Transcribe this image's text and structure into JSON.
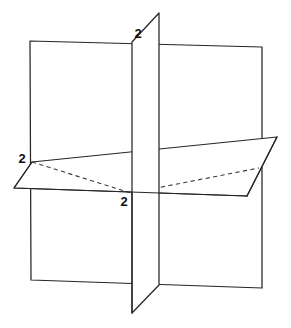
{
  "figure": {
    "background_color": "#ffffff",
    "line_color": "#26262b",
    "hidden_line_color": "#3a3a40",
    "label_color": "#0d0d10",
    "canvas": {
      "width": 291,
      "height": 328
    }
  },
  "labels": {
    "top": "2",
    "left": "2",
    "center": "2"
  },
  "label_positions": {
    "top": {
      "x": 138,
      "y": 38
    },
    "left": {
      "x": 22,
      "y": 163
    },
    "center": {
      "x": 124,
      "y": 206
    }
  },
  "chart_data": {
    "type": "diagram",
    "annotations": [
      "2",
      "2",
      "2"
    ],
    "shapes": [
      {
        "name": "back-plane",
        "kind": "square-plane",
        "points": [
          [
            30,
            41
          ],
          [
            262,
            47
          ],
          [
            262,
            288
          ],
          [
            31,
            280
          ]
        ],
        "style": "solid"
      },
      {
        "name": "back-plane-midline",
        "kind": "line",
        "points": [
          [
            31,
            166
          ],
          [
            262,
            164
          ]
        ],
        "style": "solid"
      },
      {
        "name": "vertical-front-plane",
        "kind": "parallelogram-plane",
        "points": [
          [
            159,
            13
          ],
          [
            159,
            285
          ],
          [
            132,
            313
          ],
          [
            132,
            42
          ]
        ],
        "style": "solid"
      },
      {
        "name": "horizontal-plane",
        "kind": "parallelogram-plane",
        "points": [
          [
            32,
            162
          ],
          [
            277,
            137
          ],
          [
            247,
            196
          ],
          [
            14,
            188
          ]
        ],
        "style": "solid"
      },
      {
        "name": "hidden-diagonal-left",
        "kind": "dashed-line",
        "points": [
          [
            32,
            162
          ],
          [
            131,
            193
          ]
        ],
        "style": "dashed"
      },
      {
        "name": "hidden-diagonal-right",
        "kind": "dashed-line",
        "points": [
          [
            131,
            193
          ],
          [
            259,
            168
          ]
        ],
        "style": "dashed"
      }
    ],
    "origin": {
      "x": 131,
      "y": 193
    }
  }
}
